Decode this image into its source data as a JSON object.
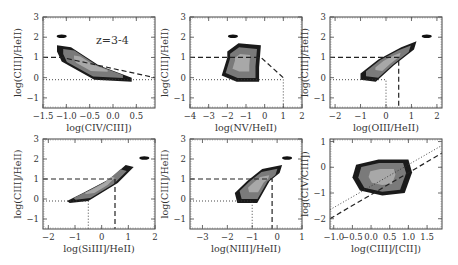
{
  "figure": {
    "annotation": "z=3-4"
  },
  "chart_data": [
    {
      "type": "heatmap",
      "panel": "top-left",
      "xlabel": "log(CIV/CIII])",
      "ylabel": "log(CIII]/HeII)",
      "xlim": [
        -1.5,
        0.9
      ],
      "ylim": [
        -1.5,
        3
      ],
      "xticks": [
        "-1.5",
        "-1.0",
        "-0.5",
        "0.0",
        "0.5"
      ],
      "xtick_values": [
        -1.5,
        -1.0,
        -0.5,
        0.0,
        0.5
      ],
      "yticks": [
        "-1",
        "0",
        "1",
        "2",
        "3"
      ],
      "ytick_values": [
        -1,
        0,
        1,
        2,
        3
      ],
      "annotation": "z=3-4",
      "dashed_lines": [
        [
          [
            -1.5,
            1.0
          ],
          [
            -1.1,
            1.0
          ],
          [
            0.9,
            0.0
          ]
        ]
      ],
      "dotted_lines": [
        [
          [
            -1.5,
            -0.1
          ],
          [
            0.9,
            -0.1
          ]
        ]
      ],
      "density_region": [
        [
          -1.2,
          1.6
        ],
        [
          -0.9,
          1.5
        ],
        [
          -0.3,
          0.6
        ],
        [
          0.4,
          0.0
        ],
        [
          0.4,
          -0.2
        ],
        [
          -0.4,
          -0.1
        ],
        [
          -1.1,
          0.8
        ],
        [
          -1.2,
          1.3
        ]
      ],
      "isolated_blob": [
        -1.1,
        2.05
      ]
    },
    {
      "type": "heatmap",
      "panel": "top-middle",
      "xlabel": "log(NV/HeII)",
      "ylabel": "log(CIII]/HeII)",
      "xlim": [
        -4,
        2
      ],
      "ylim": [
        -1.5,
        3
      ],
      "xticks": [
        "-4",
        "-3",
        "-2",
        "-1",
        "0",
        "1",
        "2"
      ],
      "xtick_values": [
        -4,
        -3,
        -2,
        -1,
        0,
        1,
        2
      ],
      "yticks": [
        "-1",
        "0",
        "1",
        "2",
        "3"
      ],
      "ytick_values": [
        -1,
        0,
        1,
        2,
        3
      ],
      "dashed_lines": [
        [
          [
            -4,
            1.0
          ],
          [
            -0.2,
            1.0
          ],
          [
            1.0,
            0.0
          ]
        ]
      ],
      "dotted_lines": [
        [
          [
            -4,
            -0.1
          ],
          [
            1.0,
            -0.1
          ],
          [
            1.0,
            -1.5
          ]
        ]
      ],
      "density_region": [
        [
          -2.0,
          1.3
        ],
        [
          -1.4,
          1.7
        ],
        [
          -0.2,
          1.6
        ],
        [
          -0.3,
          0.5
        ],
        [
          -0.3,
          -0.2
        ],
        [
          -1.5,
          -0.2
        ],
        [
          -2.3,
          0.1
        ],
        [
          -2.0,
          1.0
        ]
      ],
      "isolated_blob": [
        -1.7,
        2.05
      ]
    },
    {
      "type": "heatmap",
      "panel": "top-right",
      "xlabel": "log(OIII/HeII)",
      "ylabel": "log(CIII]/HeII)",
      "xlim": [
        -2.2,
        2.2
      ],
      "ylim": [
        -1.5,
        3
      ],
      "xticks": [
        "-2",
        "-1",
        "0",
        "1",
        "2"
      ],
      "xtick_values": [
        -2,
        -1,
        0,
        1,
        2
      ],
      "yticks": [
        "-1",
        "0",
        "1",
        "2",
        "3"
      ],
      "ytick_values": [
        -1,
        0,
        1,
        2,
        3
      ],
      "dashed_lines": [
        [
          [
            -2.2,
            1.0
          ],
          [
            0.5,
            1.0
          ],
          [
            0.5,
            -1.5
          ]
        ]
      ],
      "dotted_lines": [
        [
          [
            -2.2,
            -0.1
          ],
          [
            0.0,
            -0.1
          ],
          [
            0.0,
            -1.5
          ]
        ]
      ],
      "density_region": [
        [
          -1.0,
          0.2
        ],
        [
          -0.3,
          0.9
        ],
        [
          0.6,
          1.5
        ],
        [
          1.2,
          1.8
        ],
        [
          1.1,
          1.4
        ],
        [
          0.3,
          0.6
        ],
        [
          -0.4,
          -0.2
        ],
        [
          -1.0,
          -0.1
        ]
      ],
      "isolated_blob": [
        1.6,
        2.05
      ]
    },
    {
      "type": "heatmap",
      "panel": "bottom-left",
      "xlabel": "log(SiIII]/HeII)",
      "ylabel": "log(CIII]/HeII)",
      "xlim": [
        -2.2,
        2.0
      ],
      "ylim": [
        -1.5,
        3
      ],
      "xticks": [
        "-2",
        "-1",
        "0",
        "1",
        "2"
      ],
      "xtick_values": [
        -2,
        -1,
        0,
        1,
        2
      ],
      "yticks": [
        "-1",
        "0",
        "1",
        "2",
        "3"
      ],
      "ytick_values": [
        -1,
        0,
        1,
        2,
        3
      ],
      "dashed_lines": [
        [
          [
            -2.2,
            1.0
          ],
          [
            0.5,
            1.0
          ],
          [
            0.5,
            -1.5
          ]
        ]
      ],
      "dotted_lines": [
        [
          [
            -2.2,
            -0.1
          ],
          [
            -0.5,
            -0.1
          ],
          [
            -0.5,
            -1.5
          ]
        ]
      ],
      "density_region": [
        [
          -1.3,
          -0.1
        ],
        [
          -0.7,
          0.3
        ],
        [
          0.3,
          1.0
        ],
        [
          0.9,
          1.7
        ],
        [
          1.2,
          1.6
        ],
        [
          0.6,
          0.8
        ],
        [
          -0.5,
          -0.1
        ],
        [
          -1.2,
          -0.2
        ]
      ],
      "isolated_blob": [
        1.6,
        2.05
      ]
    },
    {
      "type": "heatmap",
      "panel": "bottom-middle",
      "xlabel": "log(NIII]/HeII)",
      "ylabel": "log(CIII]/HeII)",
      "xlim": [
        -3.5,
        1.0
      ],
      "ylim": [
        -1.5,
        3
      ],
      "xticks": [
        "-3",
        "-2",
        "-1",
        "0",
        "1"
      ],
      "xtick_values": [
        -3,
        -2,
        -1,
        0,
        1
      ],
      "yticks": [
        "-1",
        "0",
        "1",
        "2",
        "3"
      ],
      "ytick_values": [
        -1,
        0,
        1,
        2,
        3
      ],
      "dashed_lines": [
        [
          [
            -3.5,
            1.0
          ],
          [
            -0.2,
            1.0
          ],
          [
            -0.2,
            -1.5
          ]
        ]
      ],
      "dotted_lines": [
        [
          [
            -3.5,
            -0.1
          ],
          [
            -1.0,
            -0.1
          ],
          [
            -1.0,
            -1.5
          ]
        ]
      ],
      "density_region": [
        [
          -1.7,
          0.3
        ],
        [
          -1.2,
          0.9
        ],
        [
          -0.6,
          1.5
        ],
        [
          0.2,
          1.7
        ],
        [
          0.1,
          1.3
        ],
        [
          -0.3,
          0.9
        ],
        [
          -0.8,
          -0.2
        ],
        [
          -1.6,
          -0.2
        ]
      ],
      "isolated_blob": [
        0.4,
        2.05
      ]
    },
    {
      "type": "heatmap",
      "panel": "bottom-right",
      "xlabel": "log(CIII]/[CII])",
      "ylabel": "log(CIV/CIII])",
      "xlim": [
        -1.1,
        1.9
      ],
      "ylim": [
        -2.4,
        1.1
      ],
      "xticks": [
        "-1.0",
        "-0.5",
        "0.0",
        "0.5",
        "1.0",
        "1.5"
      ],
      "xtick_values": [
        -1.0,
        -0.5,
        0.0,
        0.5,
        1.0,
        1.5
      ],
      "yticks": [
        "-2",
        "-1",
        "0",
        "1"
      ],
      "ytick_values": [
        -2,
        -1,
        0,
        1
      ],
      "dashed_lines": [
        [
          [
            -1.1,
            -2.0
          ],
          [
            1.9,
            0.55
          ]
        ]
      ],
      "dotted_lines": [
        [
          [
            -1.1,
            -1.65
          ],
          [
            1.9,
            0.85
          ]
        ]
      ],
      "density_region": [
        [
          -0.4,
          0.1
        ],
        [
          0.2,
          0.3
        ],
        [
          1.0,
          0.3
        ],
        [
          1.1,
          -0.2
        ],
        [
          0.9,
          -1.0
        ],
        [
          0.3,
          -1.1
        ],
        [
          -0.3,
          -0.9
        ],
        [
          -0.5,
          -0.4
        ]
      ],
      "isolated_blob": null
    }
  ]
}
